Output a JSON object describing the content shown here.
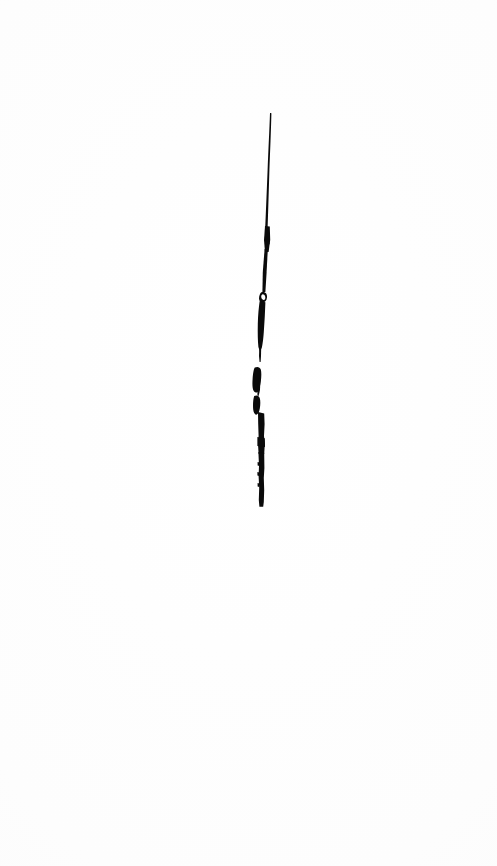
{
  "artwork": {
    "title": "Vertical Ink Stroke",
    "medium": "ink-brush-stroke",
    "canvas": {
      "width": 497,
      "height": 866,
      "background_color": "#fdfdfd",
      "paper_tone": "#fafafa"
    },
    "stroke": {
      "color": "#0a0a0a",
      "orientation": "vertical",
      "top_y": 113,
      "bottom_y": 507,
      "top_x": 270,
      "bottom_x": 261,
      "max_width_px": 7,
      "min_width_px": 1,
      "has_break": true,
      "break_y_range": [
        355,
        366
      ],
      "description": "A single near-vertical black brush stroke, thin and tapered at the top, thickening toward the middle, broken by a small gap, then resolving into short irregular blob-like segments before a blunt terminus."
    },
    "segments": [
      {
        "name": "upper-taper",
        "y_start": 113,
        "y_end": 232,
        "x_center_start": 270,
        "x_center_end": 266,
        "width_start": 1,
        "width_end": 4
      },
      {
        "name": "upper-body",
        "y_start": 232,
        "y_end": 295,
        "x_center_start": 266,
        "x_center_end": 263,
        "width_start": 3,
        "width_end": 3
      },
      {
        "name": "mid-bulge",
        "y_start": 295,
        "y_end": 345,
        "x_center_start": 263,
        "x_center_end": 261,
        "width_start": 4,
        "width_end": 6
      },
      {
        "name": "hairline-tail",
        "y_start": 345,
        "y_end": 360,
        "x_center_start": 261,
        "x_center_end": 260,
        "width_start": 2,
        "width_end": 1
      },
      {
        "name": "blob-upper",
        "y_start": 366,
        "y_end": 392,
        "x_center_start": 256,
        "x_center_end": 257,
        "width_start": 6,
        "width_end": 5
      },
      {
        "name": "blob-lower",
        "y_start": 394,
        "y_end": 414,
        "x_center_start": 256,
        "x_center_end": 259,
        "width_start": 5,
        "width_end": 6
      },
      {
        "name": "lower-shaft",
        "y_start": 414,
        "y_end": 470,
        "x_center_start": 261,
        "x_center_end": 261,
        "width_start": 6,
        "width_end": 6
      },
      {
        "name": "terminus",
        "y_start": 470,
        "y_end": 507,
        "x_center_start": 261,
        "x_center_end": 261,
        "width_start": 6,
        "width_end": 5
      }
    ]
  }
}
